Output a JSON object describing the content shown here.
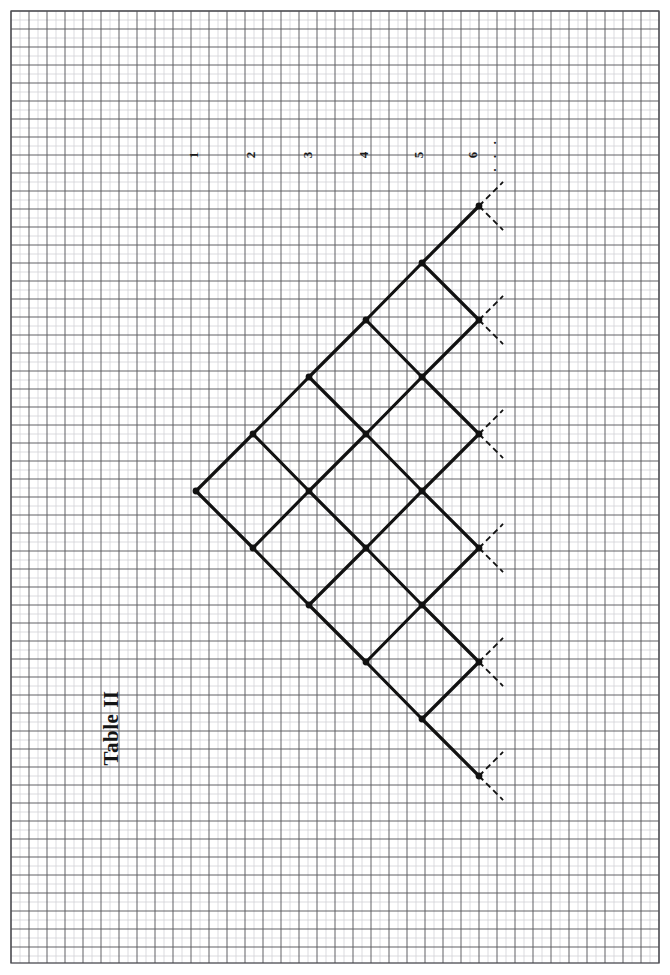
{
  "page": {
    "background_color": "#ffffff",
    "width": 670,
    "height": 975,
    "orientation": "rotated-90-ccw"
  },
  "grid": {
    "minor_color": "#cfcfd4",
    "major_color": "#58585e",
    "border_color": "#4a4a50",
    "minor_step_px": 9,
    "major_step_px": 18,
    "left": 11,
    "top": 11,
    "right": 659,
    "bottom": 963
  },
  "title": {
    "text": "Table II",
    "x": 113,
    "y": 728,
    "color": "#141414"
  },
  "column_labels": {
    "items": [
      {
        "text": "1",
        "x": 195,
        "y": 155
      },
      {
        "text": "2",
        "x": 252,
        "y": 155
      },
      {
        "text": "3",
        "x": 309,
        "y": 155
      },
      {
        "text": "4",
        "x": 365,
        "y": 155
      },
      {
        "text": "5",
        "x": 420,
        "y": 155
      },
      {
        "text": "6",
        "x": 474,
        "y": 155
      }
    ],
    "ellipsis": {
      "text": "· · ·",
      "x": 497,
      "y": 155
    }
  },
  "lattice": {
    "description": "Diamond (rotated-45) lattice: column k has k nodes; edges join node (k,i) to (k+1,i) and (k+1,i+1).",
    "origin_x": 196,
    "center_y": 491,
    "dx": 56.8,
    "dy": 56.8,
    "columns": 6,
    "edge_color": "#111111",
    "edge_width": 3.2,
    "node_color": "#111111",
    "node_radius": 3.4,
    "dashed_color": "#111111",
    "dashed_width": 1.8,
    "dashed_pattern": "6,4",
    "dashed_length": 34,
    "nodes_per_column": [
      1,
      2,
      3,
      4,
      5,
      6
    ],
    "node_positions": [
      [
        [
          196,
          491
        ]
      ],
      [
        [
          253,
          434
        ],
        [
          253,
          548
        ]
      ],
      [
        [
          309,
          377
        ],
        [
          309,
          491
        ],
        [
          309,
          605
        ]
      ],
      [
        [
          366,
          320
        ],
        [
          366,
          434
        ],
        [
          366,
          548
        ],
        [
          366,
          662
        ]
      ],
      [
        [
          422,
          263
        ],
        [
          422,
          377
        ],
        [
          422,
          491
        ],
        [
          422,
          605
        ],
        [
          422,
          719
        ]
      ],
      [
        [
          479,
          206
        ],
        [
          479,
          320
        ],
        [
          479,
          434
        ],
        [
          479,
          548
        ],
        [
          479,
          662
        ],
        [
          479,
          776
        ]
      ]
    ]
  }
}
